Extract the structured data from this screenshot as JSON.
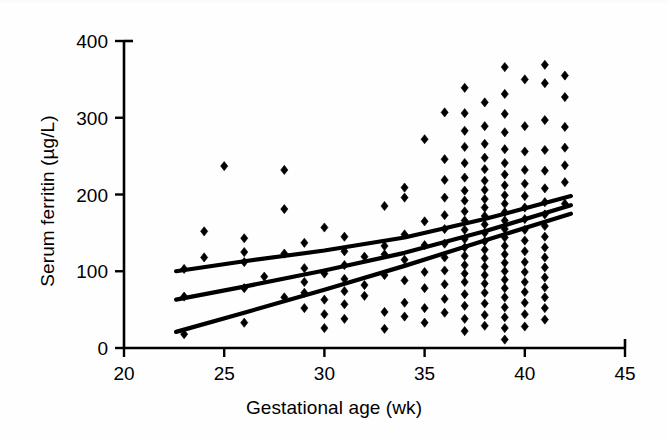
{
  "chart_data": {
    "type": "scatter",
    "title": "",
    "xlabel": "Gestational age (wk)",
    "ylabel": "Serum ferritin (µg/L)",
    "xlim": [
      20,
      45
    ],
    "ylim": [
      0,
      400
    ],
    "xticks": [
      20,
      25,
      30,
      35,
      40,
      45
    ],
    "yticks": [
      0,
      100,
      200,
      300,
      400
    ],
    "xtick_labels": [
      "20",
      "25",
      "30",
      "35",
      "40",
      "45"
    ],
    "ytick_labels": [
      "0",
      "100",
      "200",
      "300",
      "400"
    ],
    "grid": false,
    "legend": "none",
    "marker": "diamond",
    "marker_color": "#000000",
    "line_color": "#000000",
    "axis_color": "#000000",
    "background": "#ffffff",
    "points": [
      [
        23,
        18
      ],
      [
        23,
        67
      ],
      [
        23,
        103
      ],
      [
        24,
        118
      ],
      [
        24,
        152
      ],
      [
        25,
        237
      ],
      [
        26,
        33
      ],
      [
        26,
        78
      ],
      [
        26,
        112
      ],
      [
        26,
        125
      ],
      [
        26,
        143
      ],
      [
        27,
        93
      ],
      [
        28,
        66
      ],
      [
        28,
        123
      ],
      [
        28,
        181
      ],
      [
        28,
        232
      ],
      [
        29,
        52
      ],
      [
        29,
        72
      ],
      [
        29,
        86
      ],
      [
        29,
        104
      ],
      [
        29,
        137
      ],
      [
        30,
        26
      ],
      [
        30,
        44
      ],
      [
        30,
        63
      ],
      [
        30,
        97
      ],
      [
        30,
        157
      ],
      [
        31,
        38
      ],
      [
        31,
        57
      ],
      [
        31,
        74
      ],
      [
        31,
        90
      ],
      [
        31,
        108
      ],
      [
        31,
        126
      ],
      [
        31,
        145
      ],
      [
        32,
        68
      ],
      [
        32,
        82
      ],
      [
        32,
        119
      ],
      [
        33,
        25
      ],
      [
        33,
        47
      ],
      [
        33,
        95
      ],
      [
        33,
        122
      ],
      [
        33,
        133
      ],
      [
        33,
        185
      ],
      [
        34,
        41
      ],
      [
        34,
        59
      ],
      [
        34,
        88
      ],
      [
        34,
        115
      ],
      [
        34,
        148
      ],
      [
        34,
        196
      ],
      [
        34,
        209
      ],
      [
        35,
        33
      ],
      [
        35,
        52
      ],
      [
        35,
        78
      ],
      [
        35,
        99
      ],
      [
        35,
        134
      ],
      [
        35,
        165
      ],
      [
        35,
        272
      ],
      [
        36,
        46
      ],
      [
        36,
        64
      ],
      [
        36,
        83
      ],
      [
        36,
        101
      ],
      [
        36,
        118
      ],
      [
        36,
        136
      ],
      [
        36,
        155
      ],
      [
        36,
        173
      ],
      [
        36,
        196
      ],
      [
        36,
        219
      ],
      [
        36,
        246
      ],
      [
        36,
        307
      ],
      [
        37,
        22
      ],
      [
        37,
        38
      ],
      [
        37,
        55
      ],
      [
        37,
        70
      ],
      [
        37,
        86
      ],
      [
        37,
        97
      ],
      [
        37,
        108
      ],
      [
        37,
        120
      ],
      [
        37,
        131
      ],
      [
        37,
        142
      ],
      [
        37,
        154
      ],
      [
        37,
        166
      ],
      [
        37,
        178
      ],
      [
        37,
        192
      ],
      [
        37,
        205
      ],
      [
        37,
        222
      ],
      [
        37,
        241
      ],
      [
        37,
        262
      ],
      [
        37,
        283
      ],
      [
        37,
        306
      ],
      [
        37,
        339
      ],
      [
        38,
        29
      ],
      [
        38,
        43
      ],
      [
        38,
        58
      ],
      [
        38,
        72
      ],
      [
        38,
        84
      ],
      [
        38,
        95
      ],
      [
        38,
        106
      ],
      [
        38,
        117
      ],
      [
        38,
        128
      ],
      [
        38,
        139
      ],
      [
        38,
        150
      ],
      [
        38,
        161
      ],
      [
        38,
        172
      ],
      [
        38,
        183
      ],
      [
        38,
        194
      ],
      [
        38,
        206
      ],
      [
        38,
        218
      ],
      [
        38,
        233
      ],
      [
        38,
        248
      ],
      [
        38,
        266
      ],
      [
        38,
        289
      ],
      [
        38,
        320
      ],
      [
        39,
        11
      ],
      [
        39,
        26
      ],
      [
        39,
        40
      ],
      [
        39,
        53
      ],
      [
        39,
        66
      ],
      [
        39,
        78
      ],
      [
        39,
        89
      ],
      [
        39,
        100
      ],
      [
        39,
        111
      ],
      [
        39,
        122
      ],
      [
        39,
        133
      ],
      [
        39,
        144
      ],
      [
        39,
        155
      ],
      [
        39,
        166
      ],
      [
        39,
        177
      ],
      [
        39,
        188
      ],
      [
        39,
        199
      ],
      [
        39,
        212
      ],
      [
        39,
        226
      ],
      [
        39,
        241
      ],
      [
        39,
        259
      ],
      [
        39,
        281
      ],
      [
        39,
        305
      ],
      [
        39,
        331
      ],
      [
        39,
        366
      ],
      [
        40,
        28
      ],
      [
        40,
        44
      ],
      [
        40,
        59
      ],
      [
        40,
        73
      ],
      [
        40,
        86
      ],
      [
        40,
        99
      ],
      [
        40,
        112
      ],
      [
        40,
        126
      ],
      [
        40,
        140
      ],
      [
        40,
        154
      ],
      [
        40,
        168
      ],
      [
        40,
        183
      ],
      [
        40,
        198
      ],
      [
        40,
        214
      ],
      [
        40,
        232
      ],
      [
        40,
        256
      ],
      [
        40,
        289
      ],
      [
        40,
        350
      ],
      [
        41,
        37
      ],
      [
        41,
        52
      ],
      [
        41,
        66
      ],
      [
        41,
        79
      ],
      [
        41,
        92
      ],
      [
        41,
        105
      ],
      [
        41,
        118
      ],
      [
        41,
        131
      ],
      [
        41,
        145
      ],
      [
        41,
        159
      ],
      [
        41,
        174
      ],
      [
        41,
        190
      ],
      [
        41,
        208
      ],
      [
        41,
        231
      ],
      [
        41,
        258
      ],
      [
        41,
        297
      ],
      [
        41,
        345
      ],
      [
        41,
        369
      ],
      [
        42,
        188
      ],
      [
        42,
        216
      ],
      [
        42,
        238
      ],
      [
        42,
        261
      ],
      [
        42,
        288
      ],
      [
        42,
        327
      ],
      [
        42,
        355
      ]
    ],
    "lines": [
      {
        "name": "upper-curve",
        "x": [
          22.6,
          26,
          30,
          34,
          38,
          42.3
        ],
        "y": [
          100,
          113,
          127,
          144,
          168,
          198
        ]
      },
      {
        "name": "middle-curve",
        "x": [
          22.6,
          26,
          30,
          34,
          38,
          42.3
        ],
        "y": [
          63,
          80,
          101,
          124,
          152,
          186
        ]
      },
      {
        "name": "lower-curve",
        "x": [
          22.6,
          26,
          30,
          34,
          38,
          42.3
        ],
        "y": [
          21,
          46,
          76,
          107,
          140,
          175
        ]
      }
    ]
  }
}
